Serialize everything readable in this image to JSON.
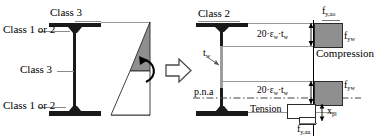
{
  "figure": {
    "background": "#ffffff",
    "ink": "#1a1a1a",
    "gray_fill": "#8f8f8f",
    "leader_color": "#8a8a8a"
  },
  "left_diagram": {
    "name": "classified-i-section-with-elastic-stress-diagram",
    "labels": {
      "top_flange": "Class 3",
      "top_flange_alt": "Class 1 or 2",
      "web": "Class 3",
      "bottom_flange": "Class 1 or 2"
    },
    "stress_diagram": {
      "type": "linear-bending-stress",
      "compression_zone_fill": "#8f8f8f",
      "tension_zone_fill": "#ffffff",
      "neutral_axis_position_ratio": 0.52,
      "rotation_arrow": "curved-arrow-clockwise"
    }
  },
  "transition": {
    "name": "transformation-arrow",
    "glyph": "block-arrow-right"
  },
  "right_diagram": {
    "name": "class-2-section-with-plastic-stress-blocks",
    "labels": {
      "top_flange": "Class 2",
      "web_thickness": "t",
      "web_thickness_sub": "w",
      "plastic_neutral_axis": "p.n.a",
      "tension_zone": "Tension",
      "compression_zone": "Compression"
    },
    "dimensions": [
      {
        "name": "upper-effective-web-depth",
        "text": "20·ε",
        "sub1": "w",
        "mid": "·t",
        "sub2": "w"
      },
      {
        "name": "lower-effective-web-depth",
        "text": "20·ε",
        "sub1": "w",
        "mid": "·t",
        "sub2": "w"
      }
    ],
    "stress_values": [
      {
        "name": "upper-flange-yield-stress",
        "symbol": "f",
        "sub": "y,ao"
      },
      {
        "name": "upper-web-yield-stress",
        "symbol": "f",
        "sub": "yw"
      },
      {
        "name": "lower-web-yield-stress",
        "symbol": "f",
        "sub": "yw"
      },
      {
        "name": "lower-flange-yield-stress",
        "symbol": "f",
        "sub": "y,au"
      },
      {
        "name": "plastic-depth",
        "symbol": "x",
        "sub": "pl"
      }
    ]
  }
}
